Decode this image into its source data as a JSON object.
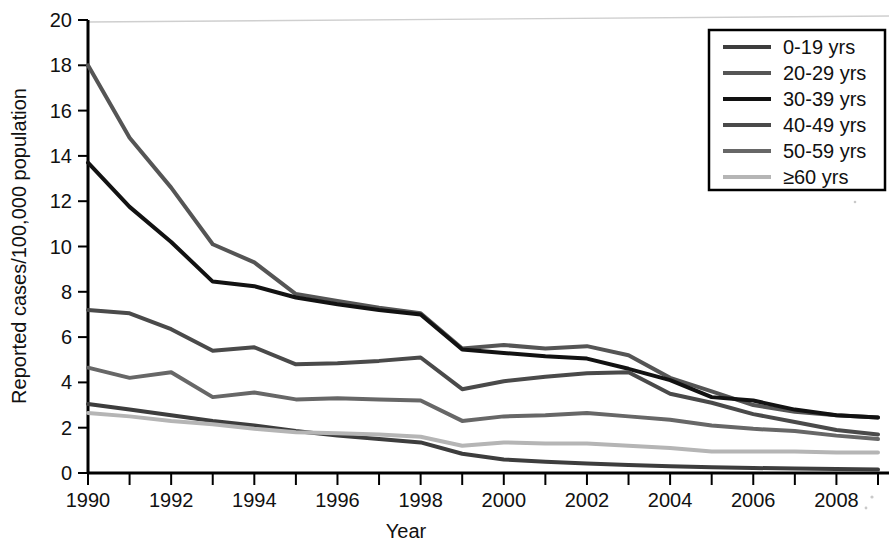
{
  "chart_data": {
    "type": "line",
    "title": "",
    "xlabel": "Year",
    "ylabel": "Reported cases/100,000 population",
    "xlim": [
      1990,
      2009
    ],
    "ylim": [
      0,
      20
    ],
    "ytick_step": 2,
    "xtick_step": 2,
    "minor_xticks": true,
    "grid": false,
    "legend_position": "top-right",
    "x": [
      1990,
      1991,
      1992,
      1993,
      1994,
      1995,
      1996,
      1997,
      1998,
      1999,
      2000,
      2001,
      2002,
      2003,
      2004,
      2005,
      2006,
      2007,
      2008,
      2009
    ],
    "xtick_labels": [
      "1990",
      "1992",
      "1994",
      "1996",
      "1998",
      "2000",
      "2002",
      "2004",
      "2006",
      "2008"
    ],
    "ytick_labels": [
      "0",
      "2",
      "4",
      "6",
      "8",
      "10",
      "12",
      "14",
      "16",
      "18",
      "20"
    ],
    "series": [
      {
        "name": "0-19 yrs",
        "color": "#3d3d3d",
        "width": 4,
        "values": [
          3.05,
          2.8,
          2.55,
          2.3,
          2.1,
          1.85,
          1.65,
          1.5,
          1.35,
          0.85,
          0.6,
          0.5,
          0.42,
          0.35,
          0.3,
          0.25,
          0.22,
          0.2,
          0.18,
          0.15
        ]
      },
      {
        "name": "20-29 yrs",
        "color": "#555555",
        "width": 4,
        "values": [
          18.0,
          14.8,
          12.6,
          10.1,
          9.3,
          7.9,
          7.6,
          7.3,
          7.05,
          5.5,
          5.65,
          5.5,
          5.6,
          5.2,
          4.2,
          3.6,
          3.0,
          2.7,
          2.55,
          2.45
        ]
      },
      {
        "name": "30-39 yrs",
        "color": "#121212",
        "width": 4,
        "values": [
          13.7,
          11.75,
          10.2,
          8.45,
          8.25,
          7.75,
          7.45,
          7.2,
          7.0,
          5.45,
          5.3,
          5.15,
          5.05,
          4.6,
          4.1,
          3.35,
          3.2,
          2.8,
          2.55,
          2.45
        ]
      },
      {
        "name": "40-49 yrs",
        "color": "#4a4a4a",
        "width": 4,
        "values": [
          7.2,
          7.05,
          6.35,
          5.4,
          5.55,
          4.8,
          4.85,
          4.95,
          5.1,
          3.7,
          4.05,
          4.25,
          4.4,
          4.45,
          3.5,
          3.1,
          2.6,
          2.25,
          1.9,
          1.7
        ]
      },
      {
        "name": "50-59 yrs",
        "color": "#676767",
        "width": 4,
        "values": [
          4.65,
          4.2,
          4.45,
          3.35,
          3.55,
          3.25,
          3.3,
          3.25,
          3.2,
          2.3,
          2.5,
          2.55,
          2.65,
          2.5,
          2.35,
          2.1,
          1.95,
          1.85,
          1.65,
          1.5
        ]
      },
      {
        "name": "≥60 yrs",
        "color": "#b5b5b5",
        "width": 4,
        "values": [
          2.65,
          2.5,
          2.3,
          2.15,
          1.95,
          1.8,
          1.75,
          1.7,
          1.6,
          1.2,
          1.35,
          1.3,
          1.3,
          1.2,
          1.1,
          0.95,
          0.95,
          0.95,
          0.9,
          0.9
        ]
      }
    ]
  },
  "legend": {
    "items": [
      {
        "label": "0-19 yrs"
      },
      {
        "label": "20-29 yrs"
      },
      {
        "label": "30-39 yrs"
      },
      {
        "label": "40-49 yrs"
      },
      {
        "label": "50-59 yrs"
      },
      {
        "label": "≥60 yrs"
      }
    ]
  },
  "axes": {
    "x_title": "Year",
    "y_title": "Reported cases/100,000 population"
  }
}
